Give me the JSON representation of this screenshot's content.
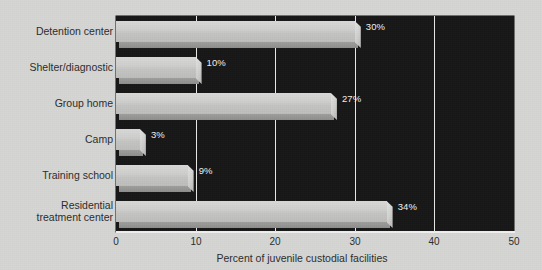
{
  "chart_data": {
    "type": "bar",
    "orientation": "horizontal",
    "title": "",
    "xlabel": "Percent of juvenile custodial facilities",
    "ylabel": "",
    "xlim": [
      0,
      50
    ],
    "xticks": [
      0,
      10,
      20,
      30,
      40,
      50
    ],
    "xtick_labels": [
      "0",
      "10",
      "20",
      "30",
      "40",
      "50"
    ],
    "grid": true,
    "grid_axis": "x",
    "legend": false,
    "categories": [
      "Detention center",
      "Shelter/diagnostic",
      "Group home",
      "Camp",
      "Training school",
      "Residential\ntreatment center"
    ],
    "values": [
      30,
      10,
      27,
      3,
      9,
      34
    ],
    "value_labels": [
      "30%",
      "10%",
      "27%",
      "3%",
      "9%",
      "34%"
    ],
    "colors": {
      "background": "#d6d6d4",
      "plot_background": "#171717",
      "bar_face": "#cfcfcd",
      "bar_shadow": "#94949 2",
      "gridline": "#e8e8e6",
      "text": "#2c2c2c",
      "value_text": "#f2f2f0"
    }
  },
  "axis": {
    "x_label": "Percent of juvenile custodial facilities",
    "ticks": [
      "0",
      "10",
      "20",
      "30",
      "40",
      "50"
    ]
  },
  "bars": [
    {
      "label": "Detention center",
      "value": "30%"
    },
    {
      "label": "Shelter/diagnostic",
      "value": "10%"
    },
    {
      "label": "Group home",
      "value": "27%"
    },
    {
      "label": "Camp",
      "value": "3%"
    },
    {
      "label": "Training school",
      "value": "9%"
    },
    {
      "label": "Residential\ntreatment center",
      "value": "34%"
    }
  ]
}
